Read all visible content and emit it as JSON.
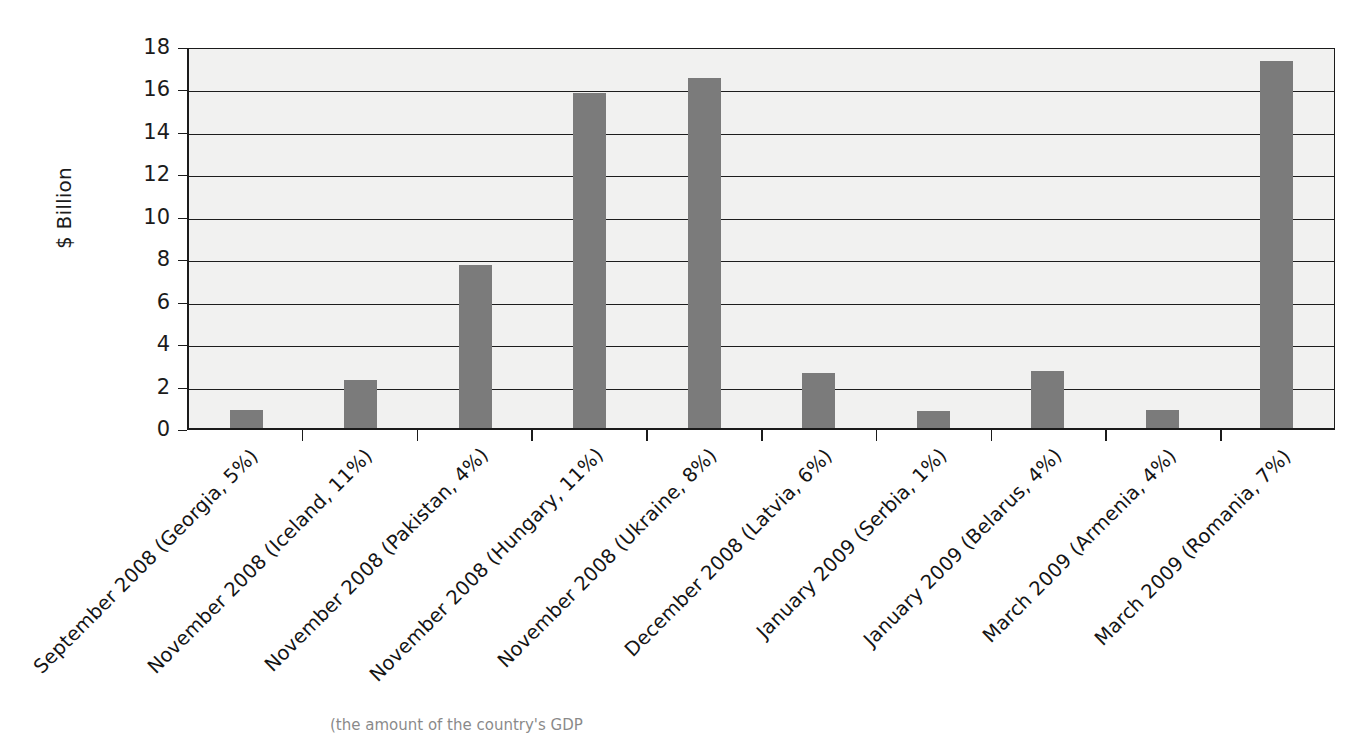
{
  "chart_data": {
    "type": "bar",
    "title": "",
    "xlabel": "",
    "ylabel": "$ Billion",
    "ylim": [
      0,
      18
    ],
    "yticks": [
      0,
      2,
      4,
      6,
      8,
      10,
      12,
      14,
      16,
      18
    ],
    "ytick_labels": [
      "0",
      "2",
      "4",
      "6",
      "8",
      "10",
      "12",
      "14",
      "16",
      "18"
    ],
    "grid": true,
    "legend": "none",
    "bar_color": "#7b7b7b",
    "plot_background": "#f1f1f0",
    "axis_color": "#1b1b1b",
    "categories": [
      "September 2008 (Georgia, 5%)",
      "November 2008 (Iceland, 11%)",
      "November 2008 (Pakistan, 4%)",
      "November 2008 (Hungary, 11%)",
      "November 2008 (Ukraine, 8%)",
      "December 2008 (Latvia, 6%)",
      "January 2009 (Serbia, 1%)",
      "January 2009 (Belarus, 4%)",
      "March 2009 (Armenia, 4%)",
      "March 2009 (Romania, 7%)"
    ],
    "values": [
      0.85,
      2.25,
      7.7,
      15.8,
      16.5,
      2.6,
      0.8,
      2.7,
      0.85,
      17.3
    ],
    "points": [
      {
        "label": "September 2008 (Georgia, 5%)",
        "country": "Georgia",
        "date": "September 2008",
        "share_of_gdp": "5%",
        "value": 0.85
      },
      {
        "label": "November 2008 (Iceland, 11%)",
        "country": "Iceland",
        "date": "November 2008",
        "share_of_gdp": "11%",
        "value": 2.25
      },
      {
        "label": "November 2008 (Pakistan, 4%)",
        "country": "Pakistan",
        "date": "November 2008",
        "share_of_gdp": "4%",
        "value": 7.7
      },
      {
        "label": "November 2008 (Hungary, 11%)",
        "country": "Hungary",
        "date": "November 2008",
        "share_of_gdp": "11%",
        "value": 15.8
      },
      {
        "label": "November 2008 (Ukraine, 8%)",
        "country": "Ukraine",
        "date": "November 2008",
        "share_of_gdp": "8%",
        "value": 16.5
      },
      {
        "label": "December 2008 (Latvia, 6%)",
        "country": "Latvia",
        "date": "December 2008",
        "share_of_gdp": "6%",
        "value": 2.6
      },
      {
        "label": "January 2009 (Serbia, 1%)",
        "country": "Serbia",
        "date": "January 2009",
        "share_of_gdp": "1%",
        "value": 0.8
      },
      {
        "label": "January 2009 (Belarus, 4%)",
        "country": "Belarus",
        "date": "January 2009",
        "share_of_gdp": "4%",
        "value": 2.7
      },
      {
        "label": "March 2009 (Armenia, 4%)",
        "country": "Armenia",
        "date": "March 2009",
        "share_of_gdp": "4%",
        "value": 0.85
      },
      {
        "label": "March 2009 (Romania, 7%)",
        "country": "Romania",
        "date": "March 2009",
        "share_of_gdp": "7%",
        "value": 17.3
      }
    ]
  },
  "caption": "(the amount of the country's GDP"
}
